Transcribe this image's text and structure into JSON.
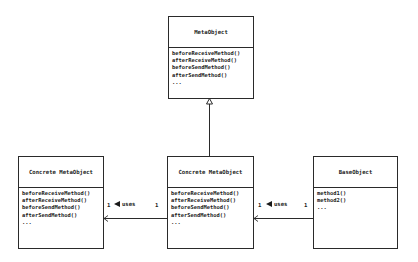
{
  "classes": {
    "meta_object": {
      "name": "MetaObject",
      "operations": [
        "beforeReceiveMethod()",
        "afterReceiveMethod()",
        "beforeSendMethod()",
        "afterSendMethod()",
        "..."
      ]
    },
    "concrete_left": {
      "name": "Concrete MetaObject",
      "operations": [
        "beforeReceiveMethod()",
        "afterReceiveMethod()",
        "beforeSendMethod()",
        "afterSendMethod()",
        "..."
      ]
    },
    "concrete_center": {
      "name": "Concrete MetaObject",
      "operations": [
        "beforeReceiveMethod()",
        "afterReceiveMethod()",
        "beforeSendMethod()",
        "afterSendMethod()",
        "..."
      ]
    },
    "base_object": {
      "name": "BaseObject",
      "operations": [
        "method1()",
        "method2()",
        "..."
      ]
    }
  },
  "associations": {
    "left": {
      "label": "uses",
      "mult_source": "1",
      "mult_target": "1"
    },
    "right": {
      "label": "uses",
      "mult_source": "1",
      "mult_target": "1"
    }
  },
  "colors": {
    "line": "#2a2a2a",
    "background": "#ffffff"
  }
}
